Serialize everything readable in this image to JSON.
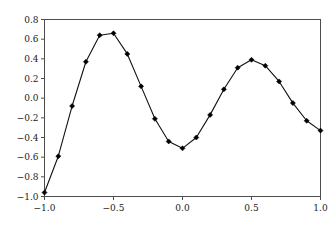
{
  "chart_data": {
    "type": "line",
    "title": "",
    "subtitle": "",
    "xlabel": "",
    "ylabel": "",
    "xlim": [
      -1.0,
      1.0
    ],
    "ylim": [
      -1.0,
      0.8
    ],
    "grid": false,
    "legend": null,
    "legend_position": "none",
    "marker": "filled-diamond",
    "line_color": "#111111",
    "marker_color": "#000000",
    "xticks": [
      -1.0,
      -0.5,
      0.0,
      0.5,
      1.0
    ],
    "xtick_labels": [
      "−1.0",
      "−0.5",
      "0.0",
      "0.5",
      "1.0"
    ],
    "yticks": [
      -1.0,
      -0.8,
      -0.6,
      -0.4,
      -0.2,
      0.0,
      0.2,
      0.4,
      0.6,
      0.8
    ],
    "ytick_labels": [
      "−1.0",
      "−0.8",
      "−0.6",
      "−0.4",
      "−0.2",
      "0.0",
      "0.2",
      "0.4",
      "0.6",
      "0.8"
    ],
    "x": [
      -1.0,
      -0.9,
      -0.8,
      -0.7,
      -0.6,
      -0.5,
      -0.4,
      -0.3,
      -0.2,
      -0.1,
      0.0,
      0.1,
      0.2,
      0.3,
      0.4,
      0.5,
      0.6,
      0.7,
      0.8,
      0.9,
      1.0
    ],
    "values": [
      -0.96,
      -0.59,
      -0.08,
      0.37,
      0.64,
      0.66,
      0.45,
      0.12,
      -0.21,
      -0.44,
      -0.51,
      -0.4,
      -0.17,
      0.09,
      0.31,
      0.39,
      0.33,
      0.17,
      -0.05,
      -0.23,
      -0.33
    ],
    "series": [
      {
        "name": "series-1",
        "values": [
          -0.96,
          -0.59,
          -0.08,
          0.37,
          0.64,
          0.66,
          0.45,
          0.12,
          -0.21,
          -0.44,
          -0.51,
          -0.4,
          -0.17,
          0.09,
          0.31,
          0.39,
          0.33,
          0.17,
          -0.05,
          -0.23,
          -0.33
        ]
      }
    ]
  },
  "figure": {
    "background_color": "#ffffff",
    "frame_color": "#4d4d4d",
    "tick_label_color": "#1a1a1a"
  }
}
